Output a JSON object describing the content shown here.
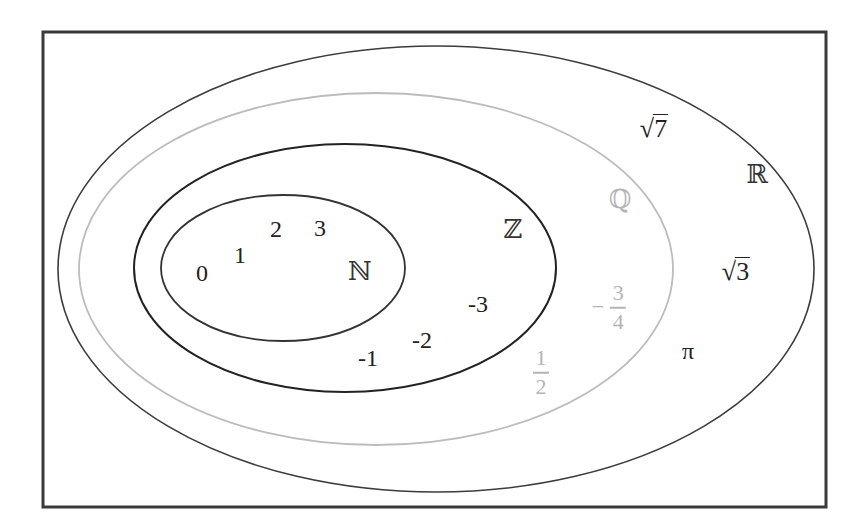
{
  "diagram": {
    "frame": {
      "x": 43,
      "y": 32,
      "width": 783,
      "height": 475,
      "stroke": "#3a3a3a",
      "stroke_width": 3
    },
    "sets": [
      {
        "id": "R",
        "symbol": "ℝ",
        "name": "Real numbers",
        "cx": 436,
        "cy": 269,
        "rx": 378,
        "ry": 223,
        "stroke": "#3c3c3c",
        "stroke_width": 1.6,
        "label_x": 757,
        "label_y": 174,
        "label_color": "#333333"
      },
      {
        "id": "Q",
        "symbol": "ℚ",
        "name": "Rational numbers",
        "cx": 376,
        "cy": 269,
        "rx": 297,
        "ry": 176,
        "stroke": "#bcbcbc",
        "stroke_width": 1.8,
        "label_x": 620,
        "label_y": 199,
        "label_color": "#b4b4b4"
      },
      {
        "id": "Z",
        "symbol": "ℤ",
        "name": "Integers",
        "cx": 345,
        "cy": 268,
        "rx": 211,
        "ry": 124,
        "stroke": "#222222",
        "stroke_width": 2,
        "label_x": 513,
        "label_y": 229,
        "label_color": "#333333"
      },
      {
        "id": "N",
        "symbol": "ℕ",
        "name": "Natural numbers",
        "cx": 283,
        "cy": 268,
        "rx": 122,
        "ry": 73,
        "stroke": "#333333",
        "stroke_width": 1.8,
        "label_x": 360,
        "label_y": 271,
        "label_color": "#333333"
      }
    ],
    "elements": {
      "naturals": [
        {
          "text": "0",
          "x": 202,
          "y": 273
        },
        {
          "text": "1",
          "x": 240,
          "y": 255
        },
        {
          "text": "2",
          "x": 276,
          "y": 229
        },
        {
          "text": "3",
          "x": 320,
          "y": 228
        }
      ],
      "integers": [
        {
          "text": "-3",
          "x": 478,
          "y": 304
        },
        {
          "text": "-2",
          "x": 422,
          "y": 340
        },
        {
          "text": "-1",
          "x": 368,
          "y": 358
        }
      ],
      "rationals": [
        {
          "type": "fraction",
          "sign": "",
          "numerator": "1",
          "denominator": "2",
          "x": 541,
          "y": 372
        },
        {
          "type": "fraction",
          "sign": "−",
          "numerator": "3",
          "denominator": "4",
          "x": 609,
          "y": 307
        }
      ],
      "irrationals": [
        {
          "type": "sqrt",
          "radicand": "7",
          "x": 654,
          "y": 128
        },
        {
          "type": "sqrt",
          "radicand": "3",
          "x": 736,
          "y": 271
        },
        {
          "type": "constant",
          "text": "π",
          "x": 688,
          "y": 351
        }
      ]
    },
    "radical_symbol": "√"
  }
}
